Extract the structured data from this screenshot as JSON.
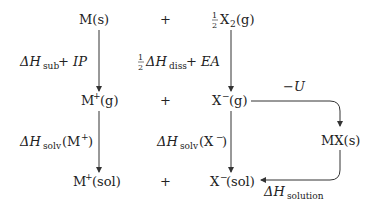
{
  "species": {
    "m_solid": "M(s)",
    "plus_1": "+",
    "half_x2": {
      "frac": "1/2",
      "base": "X",
      "sub": "2",
      "state": "(g)"
    },
    "m_gas": {
      "base": "M",
      "sup": "+",
      "state": "(g)"
    },
    "plus_2": "+",
    "x_gas": {
      "base": "X",
      "sup": "−",
      "state": "(g)"
    },
    "mx_solid": "MX(s)",
    "m_sol": {
      "base": "M",
      "sup": "+",
      "state": "(sol)"
    },
    "plus_3": "+",
    "x_sol": {
      "base": "X",
      "sup": "−",
      "state": "(sol)"
    }
  },
  "labels": {
    "sub_ip": {
      "delta": "ΔH",
      "sub": "sub",
      "rest": " + IP"
    },
    "diss_ea": {
      "frac": "1/2",
      "delta": "ΔH",
      "sub": "diss",
      "rest": " + EA"
    },
    "neg_u": "−U",
    "solv_m": {
      "delta": "ΔH",
      "sub": "solv",
      "arg": "(M",
      "sup": "+",
      "close": ")"
    },
    "solv_x": {
      "delta": "ΔH",
      "sub": "solv",
      "arg": "(X",
      "sup": "−",
      "close": ")"
    },
    "solution": {
      "delta": "ΔH",
      "sub": "solution"
    }
  },
  "colors": {
    "stroke": "#333333",
    "text": "#222222",
    "background": "#ffffff"
  }
}
